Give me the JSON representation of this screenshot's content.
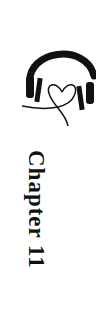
{
  "logo": {
    "icon": "headphones-heart-icon"
  },
  "title": "Chapter 11",
  "colors": {
    "ink": "#111111",
    "background": "#ffffff"
  }
}
